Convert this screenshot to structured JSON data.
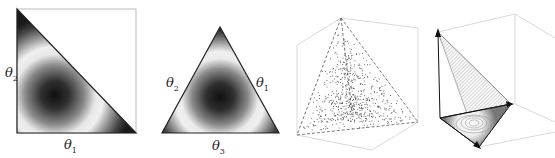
{
  "figure": {
    "panels": [
      {
        "id": "simplex-2d-right",
        "type": "density-contour-right-triangle",
        "labels": {
          "vertical": "θ2",
          "horizontal": "θ1"
        }
      },
      {
        "id": "simplex-2d-equilateral",
        "type": "density-contour-equilateral-triangle",
        "labels": {
          "left": "θ2",
          "right": "θ1",
          "bottom": "θ3"
        }
      },
      {
        "id": "simplex-3d-scatter",
        "type": "3d-tetrahedron-scatter-samples"
      },
      {
        "id": "simplex-3d-contour",
        "type": "3d-simplex-contour-surface"
      }
    ],
    "colors": {
      "density_high": "#111111",
      "density_low": "#f2f2f2",
      "edge": "#222222",
      "box": "#bbbbbb",
      "scatter": "#555555"
    }
  },
  "chart_data": {
    "type": "diagram",
    "title": "",
    "panels": [
      {
        "type": "heatmap",
        "domain": "2-simplex (θ1, θ2)",
        "xlabel": "θ1",
        "ylabel": "θ2",
        "mode_location": "interior, near (0.35, 0.3)"
      },
      {
        "type": "heatmap",
        "domain": "2-simplex barycentric",
        "vertex_labels": [
          "θ1",
          "θ2",
          "θ3"
        ],
        "mode_location": "centroid"
      },
      {
        "type": "scatter",
        "domain": "3-simplex tetrahedron",
        "points": "uniform random samples"
      },
      {
        "type": "contour",
        "domain": "3-simplex tetrahedron faces"
      }
    ]
  }
}
